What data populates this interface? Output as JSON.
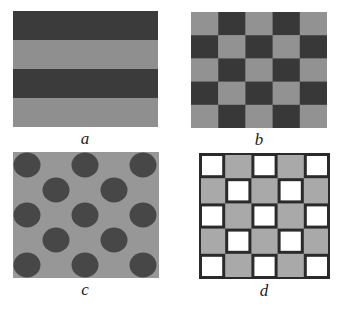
{
  "panels": [
    {
      "id": "a",
      "label": "a",
      "pattern": "horizontal-stripes",
      "rows": 4,
      "colors": {
        "dark": "#3b3b3b",
        "light": "#8f8f8f"
      }
    },
    {
      "id": "b",
      "label": "b",
      "pattern": "checkerboard",
      "rows": 5,
      "cols": 5,
      "colors": {
        "dark": "#383838",
        "light": "#929292"
      }
    },
    {
      "id": "c",
      "label": "c",
      "pattern": "staggered-circles",
      "colors": {
        "background": "#979797",
        "circle": "#474747"
      }
    },
    {
      "id": "d",
      "label": "d",
      "pattern": "bordered-checkerboard",
      "rows": 5,
      "cols": 5,
      "colors": {
        "grid": "#2a2a2a",
        "fill": "#a9a9a9",
        "open": "#ffffff"
      }
    }
  ]
}
